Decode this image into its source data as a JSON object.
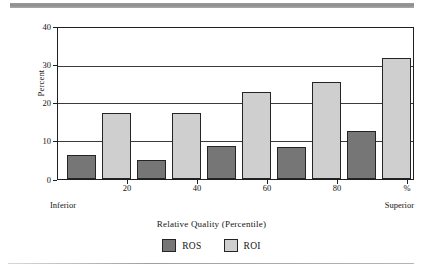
{
  "figure": {
    "top_rule_color": "#8d8d8d",
    "bottom_rule_color": "#a0a0a0"
  },
  "chart_data": {
    "type": "bar",
    "title": "",
    "xlabel": "Relative Quality (Percentile)",
    "ylabel": "Percent",
    "categories": [
      "10",
      "30",
      "50",
      "70",
      "90"
    ],
    "series": [
      {
        "name": "ROS",
        "color": "#767676",
        "values": [
          6.3,
          5.0,
          8.8,
          8.6,
          12.7
        ]
      },
      {
        "name": "ROI",
        "color": "#cfcfcf",
        "values": [
          17.4,
          17.4,
          23.1,
          25.7,
          32.0
        ]
      }
    ],
    "ylim": [
      0,
      40
    ],
    "yticks": [
      "0",
      "10",
      "20",
      "30",
      "40"
    ],
    "xticks": [
      "20",
      "40",
      "60",
      "80",
      "%"
    ],
    "xaxis_end_labels": {
      "left": "Inferior",
      "right": "Superior"
    },
    "grid": true,
    "legend_position": "bottom-center",
    "legend": [
      "ROS",
      "ROI"
    ]
  }
}
